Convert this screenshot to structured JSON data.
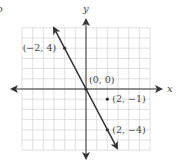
{
  "corner_fragment": "o",
  "chart_data": {
    "type": "line",
    "title": "",
    "xlabel": "x",
    "ylabel": "y",
    "xlim": [
      -6,
      6
    ],
    "ylim": [
      -6,
      6
    ],
    "grid": true,
    "series": [
      {
        "name": "y = -2x",
        "x": [
          -2.5,
          3
        ],
        "y": [
          5,
          -6
        ],
        "style": "line with arrows both ends"
      }
    ],
    "points": [
      {
        "x": -2,
        "y": 4,
        "label": "(−2, 4)",
        "on_line": true
      },
      {
        "x": 0,
        "y": 0,
        "label": "(0, 0)",
        "on_line": true
      },
      {
        "x": 2,
        "y": -1,
        "label": "(2, −1)",
        "on_line": false
      },
      {
        "x": 2,
        "y": -4,
        "label": "(2, −4)",
        "on_line": true
      }
    ],
    "colors": {
      "line": "#333333",
      "grid": "#d8d8d8",
      "axes": "#333333"
    }
  }
}
